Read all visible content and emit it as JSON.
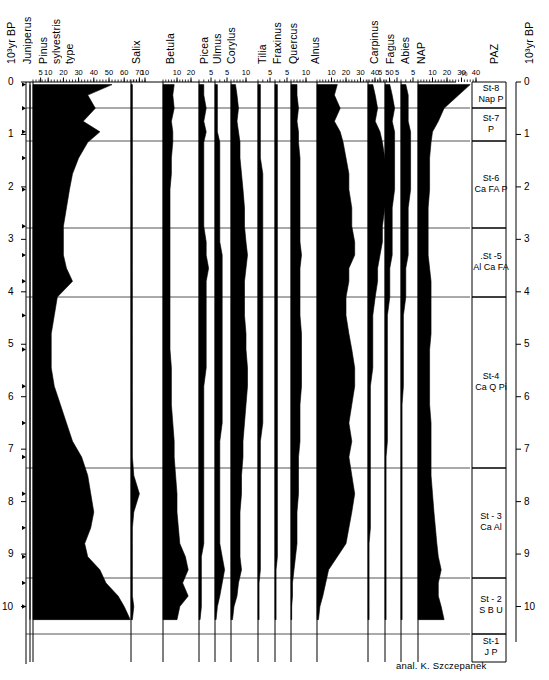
{
  "figure": {
    "type": "pollen-percentage-diagram",
    "credit": "anal. K. Szczepanek",
    "axis_left_label": "10³yr  BP",
    "axis_right_label": "10³yr  BP",
    "percent_symbol": "%",
    "paz_header": "PAZ",
    "depth_ticks": [
      "0",
      "1",
      "2",
      "3",
      "4",
      "5",
      "6",
      "7",
      "8",
      "9",
      "10"
    ],
    "plot_top_y": 82,
    "plot_bottom_y": 638,
    "ink_color": "#000000",
    "grid_color": "#555555"
  },
  "taxa": [
    {
      "name": "Juniperus",
      "label": "Juniperus",
      "base_x": 30,
      "scale_px_per_pct": 0.0,
      "ticks": [],
      "single": true
    },
    {
      "name": "Pinus sylvestris type",
      "label": "Pinus\nsylvestris\ntype",
      "base_x": 33,
      "scale_px_per_pct": 1.52,
      "ticks": [
        5,
        10,
        20,
        30,
        40,
        50,
        60,
        70
      ]
    },
    {
      "name": "Salix",
      "label": "Salix",
      "base_x": 131,
      "scale_px_per_pct": 1.4,
      "ticks": [
        10
      ]
    },
    {
      "name": "Betula",
      "label": "Betula",
      "base_x": 163,
      "scale_px_per_pct": 1.4,
      "ticks": [
        10,
        20
      ]
    },
    {
      "name": "Picea",
      "label": "Picea",
      "base_x": 199,
      "scale_px_per_pct": 2.4,
      "ticks": [
        5
      ]
    },
    {
      "name": "Ulmus",
      "label": "Ulmus",
      "base_x": 215,
      "scale_px_per_pct": 2.4,
      "ticks": [
        5
      ]
    },
    {
      "name": "Corylus",
      "label": "Corylus",
      "base_x": 231,
      "scale_px_per_pct": 1.5,
      "ticks": [
        10
      ]
    },
    {
      "name": "Tilia",
      "label": "Tilia",
      "base_x": 258,
      "scale_px_per_pct": 2.4,
      "ticks": [
        5
      ]
    },
    {
      "name": "Fraxinus",
      "label": "Fraxinus",
      "base_x": 275,
      "scale_px_per_pct": 2.4,
      "ticks": [
        5
      ]
    },
    {
      "name": "Quercus",
      "label": "Quercus",
      "base_x": 291,
      "scale_px_per_pct": 1.5,
      "ticks": [
        10
      ]
    },
    {
      "name": "Alnus",
      "label": "Alnus",
      "base_x": 317,
      "scale_px_per_pct": 1.45,
      "ticks": [
        10,
        20,
        30,
        40,
        50
      ]
    },
    {
      "name": "Carpinus",
      "label": "Carpinus",
      "base_x": 368,
      "scale_px_per_pct": 2.4,
      "ticks": [
        5
      ]
    },
    {
      "name": "Fagus",
      "label": "Fagus",
      "base_x": 385,
      "scale_px_per_pct": 2.4,
      "ticks": [
        5
      ]
    },
    {
      "name": "Abies",
      "label": "Abies",
      "base_x": 401,
      "scale_px_per_pct": 2.4,
      "ticks": [
        5
      ]
    },
    {
      "name": "NAP",
      "label": "NAP",
      "base_x": 418,
      "scale_px_per_pct": 1.45,
      "ticks": [
        10,
        20,
        30,
        40
      ]
    }
  ],
  "paz_zones": [
    {
      "code": "St-8",
      "taxa": "Nap P",
      "top_y": 82,
      "bottom_y": 108
    },
    {
      "code": "St-7",
      "taxa": "P",
      "top_y": 108,
      "bottom_y": 141
    },
    {
      "code": "St-6",
      "taxa": "Ca FA P",
      "top_y": 141,
      "bottom_y": 228
    },
    {
      "code": ".St -5",
      "taxa": "Al Ca FA",
      "top_y": 228,
      "bottom_y": 297
    },
    {
      "code": "St-4",
      "taxa": "Ca Q Pi",
      "top_y": 297,
      "bottom_y": 468
    },
    {
      "code": "St - 3",
      "taxa": "Ca Al",
      "top_y": 468,
      "bottom_y": 578
    },
    {
      "code": "St - 2",
      "taxa": "S B U",
      "top_y": 578,
      "bottom_y": 634
    },
    {
      "code": "St-1",
      "taxa": "J P",
      "top_y": 634,
      "bottom_y": 662
    }
  ],
  "chart_data": {
    "type": "area",
    "title": "",
    "xlabel": "%",
    "ylabel": "10³yr BP",
    "ylim": [
      0,
      10.6
    ],
    "grid": true,
    "legend": "none",
    "depths_kyr": [
      0.05,
      0.25,
      0.5,
      0.75,
      0.95,
      1.15,
      1.45,
      1.75,
      2.05,
      2.4,
      2.75,
      3.05,
      3.3,
      3.55,
      3.8,
      4.1,
      4.45,
      4.8,
      5.1,
      5.45,
      5.8,
      6.15,
      6.5,
      6.85,
      7.15,
      7.5,
      7.85,
      8.2,
      8.5,
      8.8,
      9.05,
      9.3,
      9.55,
      9.8,
      10.0,
      10.25
    ],
    "series": [
      {
        "name": "Juniperus",
        "values": [
          0,
          0,
          0,
          0,
          0,
          0,
          0,
          0,
          0,
          0,
          0,
          0,
          0,
          0,
          0,
          0,
          0,
          0,
          0,
          0,
          0,
          0,
          0,
          0,
          0,
          0,
          0,
          0,
          0,
          0,
          0,
          0,
          0,
          1,
          3,
          4
        ]
      },
      {
        "name": "Pinus sylvestris type",
        "values": [
          52,
          36,
          41,
          33,
          44,
          36,
          30,
          26,
          24,
          22,
          20,
          20,
          20,
          22,
          26,
          16,
          14,
          12,
          12,
          12,
          14,
          18,
          22,
          26,
          32,
          36,
          38,
          40,
          38,
          34,
          36,
          44,
          48,
          56,
          60,
          64
        ]
      },
      {
        "name": "Salix",
        "values": [
          1,
          1,
          1,
          1,
          1,
          1,
          1,
          1,
          1,
          1,
          1,
          1,
          1,
          1,
          1,
          1,
          1,
          1,
          1,
          1,
          1,
          1,
          1,
          1,
          1,
          2,
          6,
          2,
          1,
          1,
          1,
          1,
          1,
          1,
          2,
          1
        ]
      },
      {
        "name": "Betula",
        "values": [
          8,
          7,
          8,
          6,
          7,
          7,
          6,
          6,
          5,
          5,
          5,
          5,
          5,
          5,
          5,
          5,
          5,
          5,
          5,
          6,
          6,
          6,
          7,
          8,
          8,
          9,
          10,
          10,
          11,
          12,
          16,
          18,
          14,
          18,
          12,
          10
        ]
      },
      {
        "name": "Picea",
        "values": [
          2,
          2,
          3,
          2,
          3,
          2,
          2,
          2,
          2,
          2,
          2,
          3,
          3,
          4,
          3,
          3,
          3,
          3,
          3,
          3,
          2,
          2,
          2,
          2,
          2,
          2,
          2,
          2,
          2,
          2,
          1,
          1,
          1,
          1,
          1,
          0
        ]
      },
      {
        "name": "Ulmus",
        "values": [
          1,
          1,
          1,
          1,
          1,
          2,
          2,
          2,
          2,
          2,
          2,
          2,
          3,
          3,
          3,
          3,
          3,
          3,
          3,
          3,
          3,
          3,
          3,
          2,
          2,
          2,
          2,
          2,
          2,
          2,
          3,
          4,
          3,
          2,
          1,
          0
        ]
      },
      {
        "name": "Corylus",
        "values": [
          3,
          4,
          5,
          4,
          5,
          6,
          6,
          7,
          8,
          9,
          9,
          10,
          11,
          10,
          9,
          9,
          9,
          10,
          10,
          11,
          11,
          10,
          9,
          8,
          8,
          7,
          7,
          6,
          6,
          6,
          6,
          7,
          5,
          4,
          2,
          1
        ]
      },
      {
        "name": "Tilia",
        "values": [
          1,
          1,
          1,
          1,
          1,
          1,
          1,
          2,
          2,
          2,
          2,
          2,
          2,
          2,
          2,
          2,
          2,
          2,
          2,
          2,
          2,
          2,
          2,
          1,
          1,
          1,
          1,
          1,
          1,
          1,
          1,
          1,
          0,
          0,
          0,
          0
        ]
      },
      {
        "name": "Fraxinus",
        "values": [
          1,
          1,
          1,
          1,
          1,
          1,
          1,
          1,
          1,
          1,
          1,
          1,
          1,
          1,
          1,
          1,
          1,
          1,
          1,
          1,
          1,
          1,
          1,
          1,
          1,
          1,
          1,
          1,
          1,
          1,
          1,
          0,
          0,
          0,
          0,
          0
        ]
      },
      {
        "name": "Quercus",
        "values": [
          4,
          4,
          5,
          4,
          5,
          5,
          6,
          6,
          6,
          6,
          6,
          6,
          7,
          6,
          6,
          6,
          6,
          7,
          7,
          7,
          7,
          6,
          6,
          6,
          5,
          5,
          5,
          4,
          4,
          4,
          3,
          2,
          1,
          1,
          0,
          0
        ]
      },
      {
        "name": "Alnus",
        "values": [
          14,
          12,
          16,
          12,
          16,
          18,
          20,
          22,
          22,
          24,
          24,
          26,
          26,
          22,
          22,
          20,
          20,
          22,
          24,
          26,
          26,
          24,
          22,
          24,
          22,
          24,
          26,
          24,
          22,
          20,
          14,
          8,
          6,
          4,
          2,
          1
        ]
      },
      {
        "name": "Carpinus",
        "values": [
          2,
          3,
          4,
          3,
          5,
          6,
          7,
          8,
          8,
          7,
          6,
          6,
          5,
          4,
          4,
          3,
          2,
          2,
          2,
          2,
          1,
          1,
          1,
          1,
          1,
          1,
          1,
          1,
          1,
          0,
          0,
          0,
          0,
          0,
          0,
          0
        ]
      },
      {
        "name": "Fagus",
        "values": [
          2,
          3,
          4,
          3,
          4,
          4,
          4,
          4,
          4,
          3,
          3,
          3,
          3,
          2,
          2,
          2,
          1,
          1,
          1,
          1,
          1,
          1,
          1,
          1,
          0,
          0,
          0,
          0,
          0,
          0,
          0,
          0,
          0,
          0,
          0,
          0
        ]
      },
      {
        "name": "Abies",
        "values": [
          2,
          3,
          3,
          3,
          4,
          4,
          4,
          4,
          4,
          3,
          3,
          3,
          3,
          2,
          2,
          2,
          1,
          1,
          1,
          1,
          1,
          0,
          0,
          0,
          0,
          0,
          0,
          0,
          0,
          0,
          0,
          0,
          0,
          0,
          0,
          0
        ]
      },
      {
        "name": "NAP",
        "values": [
          36,
          28,
          18,
          14,
          10,
          9,
          8,
          8,
          8,
          7,
          7,
          7,
          7,
          8,
          9,
          9,
          9,
          9,
          8,
          8,
          8,
          8,
          9,
          9,
          9,
          9,
          10,
          11,
          12,
          13,
          14,
          16,
          14,
          14,
          16,
          18
        ]
      }
    ]
  }
}
